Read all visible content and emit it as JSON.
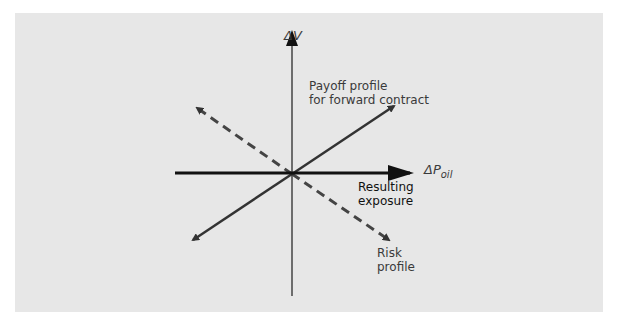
{
  "diagram": {
    "y_axis_label": "ΔV",
    "x_axis_label_main": "ΔP",
    "x_axis_label_sub": "oil",
    "payoff_label_line1": "Payoff profile",
    "payoff_label_line2": "for forward contract",
    "resulting_label_line1": "Resulting",
    "resulting_label_line2": "exposure",
    "risk_label_line1": "Risk",
    "risk_label_line2": "profile",
    "colors": {
      "background": "#e7e7e7",
      "lines": "#333333",
      "resulting_exposure": "#111111"
    }
  }
}
